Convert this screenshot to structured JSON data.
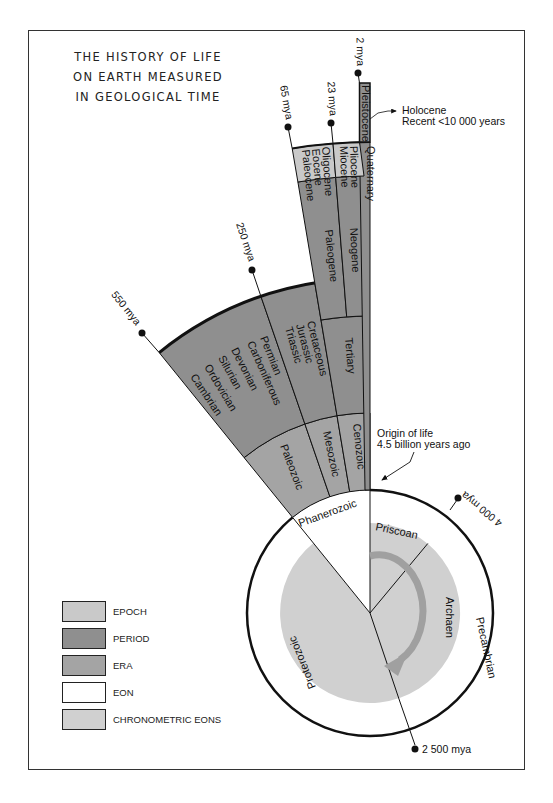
{
  "title": {
    "lines": [
      "THE HISTORY OF LIFE",
      "ON EARTH MEASURED",
      "IN GEOLOGICAL TIME"
    ]
  },
  "colors": {
    "epoch": "#c9c9c9",
    "period": "#8f8f8f",
    "era": "#a4a4a4",
    "eon": "#ffffff",
    "chronometric_eons": "#d0d0d0",
    "arrow": "#a0a0a0",
    "line": "#111111"
  },
  "time_markers": {
    "m2": "2 mya",
    "m23": "23 mya",
    "m65": "65 mya",
    "m250": "250 mya",
    "m550": "550 mya",
    "m4000": "4 000 mya",
    "m2500": "2 500 mya"
  },
  "epochs": {
    "pleistocene": "Pleistocene",
    "pliocene": "Pliocene",
    "miocene": "Miocene",
    "oligocene": "Oligocene",
    "eocene": "Eocene",
    "paleocene": "Paleocene"
  },
  "periods": {
    "quaternary": "Quaternary",
    "neogene": "Neogene",
    "paleogene": "Paleogene",
    "tertiary": "Tertiary",
    "mesozoic_periods": [
      "Cretaceous",
      "Jurassic",
      "Triassic"
    ],
    "paleozoic_periods": [
      "Permian",
      "Carboniferous",
      "Devonian",
      "Silurian",
      "Ordovician",
      "Cambrian"
    ]
  },
  "eras": {
    "cenozoic": "Cenozoic",
    "mesozoic": "Mesozoic",
    "paleozoic": "Paleozoic"
  },
  "eons": {
    "phanerozoic": "Phanerozoic",
    "precambrian": "Precambrian"
  },
  "chronometric_eons": {
    "priscoan": "Priscoan",
    "archaen": "Archaen",
    "proterozoic": "Proterozoic"
  },
  "annotations": {
    "holocene_line1": "Holocene",
    "holocene_line2": "Recent <10 000 years",
    "origin_line1": "Origin of life",
    "origin_line2": "4.5 billion years ago"
  },
  "legend": [
    {
      "label": "EPOCH",
      "color": "#c9c9c9"
    },
    {
      "label": "PERIOD",
      "color": "#8f8f8f"
    },
    {
      "label": "ERA",
      "color": "#a4a4a4"
    },
    {
      "label": "EON",
      "color": "#ffffff"
    },
    {
      "label": "CHRONOMETRIC EONS",
      "color": "#d0d0d0"
    }
  ]
}
